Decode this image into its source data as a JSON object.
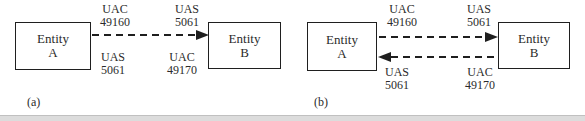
{
  "figure": {
    "panel_a": {
      "caption": "(a)",
      "entity_left": {
        "name_line1": "Entity",
        "name_line2": "A"
      },
      "entity_right": {
        "name_line1": "Entity",
        "name_line2": "B"
      },
      "top_left_label": {
        "role": "UAC",
        "port": "49160"
      },
      "top_right_label": {
        "role": "UAS",
        "port": "5061"
      },
      "bottom_left_label": {
        "role": "UAS",
        "port": "5061"
      },
      "bottom_right_label": {
        "role": "UAC",
        "port": "49170"
      }
    },
    "panel_b": {
      "caption": "(b)",
      "entity_left": {
        "name_line1": "Entity",
        "name_line2": "A"
      },
      "entity_right": {
        "name_line1": "Entity",
        "name_line2": "B"
      },
      "top_left_label": {
        "role": "UAC",
        "port": "49160"
      },
      "top_right_label": {
        "role": "UAS",
        "port": "5061"
      },
      "bottom_left_label": {
        "role": "UAS",
        "port": "5061"
      },
      "bottom_right_label": {
        "role": "UAC",
        "port": "49170"
      }
    },
    "colors": {
      "line": "#1f1f1f",
      "text": "#2b2b2b",
      "bottom_bar": "#dcdcdc"
    }
  }
}
